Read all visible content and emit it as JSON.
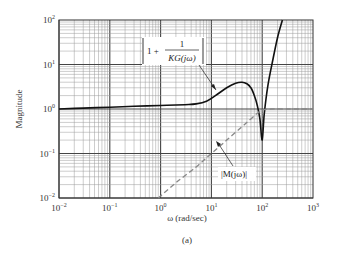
{
  "chart_data": {
    "type": "line",
    "title": "",
    "caption": "(a)",
    "xlabel": "ω (rad/sec)",
    "ylabel": "Magnitude",
    "xscale": "log",
    "yscale": "log",
    "xlim": [
      0.01,
      1000
    ],
    "ylim": [
      0.01,
      100
    ],
    "grid": true,
    "x_ticks": [
      {
        "base": "10",
        "exp": "−2"
      },
      {
        "base": "10",
        "exp": "−1"
      },
      {
        "base": "10",
        "exp": "0"
      },
      {
        "base": "10",
        "exp": "1"
      },
      {
        "base": "10",
        "exp": "2"
      },
      {
        "base": "10",
        "exp": "3"
      }
    ],
    "y_ticks": [
      {
        "base": "10",
        "exp": "2"
      },
      {
        "base": "10",
        "exp": "1"
      },
      {
        "base": "10",
        "exp": "0"
      },
      {
        "base": "10",
        "exp": "−1"
      },
      {
        "base": "10",
        "exp": "−2"
      }
    ],
    "series": [
      {
        "name": "|1 + 1/KG(jω)|",
        "style": "solid",
        "color": "#111111",
        "x": [
          0.01,
          0.03,
          0.1,
          0.3,
          1,
          3,
          5,
          8,
          12,
          20,
          30,
          40,
          50,
          60,
          70,
          80,
          90,
          100,
          110,
          130,
          160,
          200,
          250
        ],
        "y": [
          1.0,
          1.05,
          1.1,
          1.15,
          1.2,
          1.25,
          1.3,
          1.5,
          2.0,
          3.0,
          3.8,
          4.0,
          3.7,
          3.0,
          2.0,
          1.2,
          0.6,
          0.2,
          0.8,
          3.5,
          12,
          40,
          100
        ]
      },
      {
        "name": "|M(jω)|",
        "style": "dashed",
        "color": "#888888",
        "x": [
          0.9,
          2,
          5,
          10,
          20,
          40,
          60,
          80,
          100,
          150,
          300,
          1000
        ],
        "y": [
          0.01,
          0.022,
          0.05,
          0.1,
          0.2,
          0.4,
          0.6,
          0.8,
          0.95,
          1.0,
          1.0,
          1.0
        ]
      }
    ],
    "annotations": [
      {
        "label_parts": [
          "1 +",
          "1",
          "KG(jω)"
        ],
        "target_series": "|1 + 1/KG(jω)|"
      },
      {
        "text": "|M(jω)|",
        "target_series": "|M(jω)|"
      }
    ]
  }
}
